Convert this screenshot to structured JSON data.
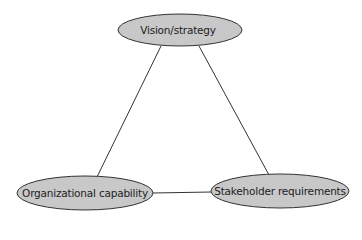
{
  "diagram": {
    "type": "triangle",
    "colors": {
      "node_fill": "#c8c8c8",
      "node_stroke": "#333333",
      "edge": "#333333",
      "background": "#ffffff"
    },
    "nodes": [
      {
        "id": "vision",
        "label": "Vision/strategy",
        "cx": 180,
        "cy": 30,
        "rx": 62,
        "ry": 16
      },
      {
        "id": "org",
        "label": "Organizational capability",
        "cx": 85,
        "cy": 193,
        "rx": 68,
        "ry": 17
      },
      {
        "id": "stake",
        "label": "Stakeholder requirements",
        "cx": 280,
        "cy": 191,
        "rx": 69,
        "ry": 17
      }
    ],
    "edges": [
      {
        "from": "vision",
        "to": "org"
      },
      {
        "from": "vision",
        "to": "stake"
      },
      {
        "from": "org",
        "to": "stake"
      }
    ]
  }
}
